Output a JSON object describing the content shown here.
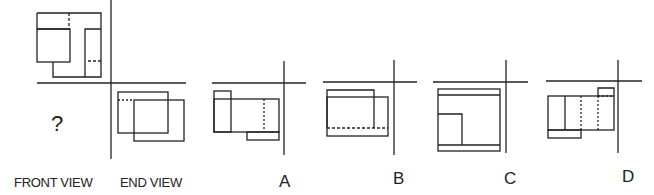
{
  "puzzle": {
    "question_mark": "?",
    "labels": {
      "front_view": "FRONT VIEW",
      "end_view": "END VIEW"
    },
    "options": [
      {
        "key": "A",
        "label": "A"
      },
      {
        "key": "B",
        "label": "B"
      },
      {
        "key": "C",
        "label": "C"
      },
      {
        "key": "D",
        "label": "D"
      }
    ]
  },
  "colors": {
    "line": "#222222",
    "background": "#ffffff"
  }
}
